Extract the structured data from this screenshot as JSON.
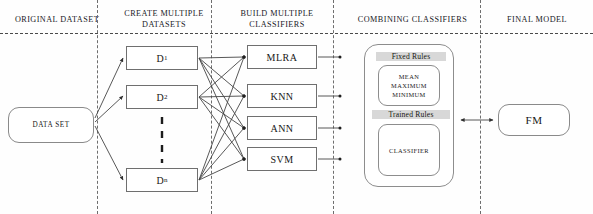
{
  "diagram": {
    "columns": [
      {
        "label": "ORIGINAL DATASET"
      },
      {
        "label": "CREATE MULTIPLE DATASETS"
      },
      {
        "label": "BUILD MULTIPLE CLASSIFIERS"
      },
      {
        "label": "COMBINING CLASSIFIERS"
      },
      {
        "label": "FINAL MODEL"
      }
    ],
    "source": {
      "label": "DATA SET"
    },
    "datasets": [
      {
        "label": "D",
        "subscript": "1"
      },
      {
        "label": "D",
        "subscript": "2"
      },
      {
        "label": "D",
        "subscript": "n"
      }
    ],
    "datasets_ellipsis": "vertical-dashed-ellipsis",
    "classifiers": [
      {
        "label": "MLRA"
      },
      {
        "label": "KNN"
      },
      {
        "label": "ANN"
      },
      {
        "label": "SVM"
      }
    ],
    "combining": {
      "fixed_rules_label": "Fixed Rules",
      "fixed_rules_items": "MEAN\nMAXIMUM\nMINIMUM",
      "fixed_rules_item_1": "MEAN",
      "fixed_rules_item_2": "MAXIMUM",
      "fixed_rules_item_3": "MINIMUM",
      "trained_rules_label": "Trained Rules",
      "trained_rules_item": "CLASSIFIER"
    },
    "final_model": {
      "label": "FM"
    },
    "colors": {
      "stroke": "#6f6f6f",
      "divider": "#6d6d6d",
      "highlight": "#d8d8d8",
      "text": "#171717",
      "background": "#ffffff"
    }
  }
}
